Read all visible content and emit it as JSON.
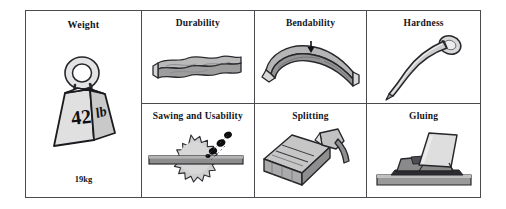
{
  "figure": {
    "name": "wood-properties-comparison-chart",
    "background_color": "#ffffff",
    "border_color": "#4a4a4f",
    "fill_light": "#e8e8e8",
    "fill_mid": "#bfbfbf",
    "fill_dark": "#8f8f8f",
    "ink_color": "#15151a"
  },
  "cells": {
    "weight": {
      "title": "Weight",
      "value_on_icon_number": "42",
      "value_on_icon_unit": "lb",
      "caption": "19kg",
      "icon": "weight-block-icon"
    },
    "durability": {
      "title": "Durability",
      "icon": "wooden-plank-icon"
    },
    "bendability": {
      "title": "Bendability",
      "icon": "bent-beam-with-arrow-icon"
    },
    "hardness": {
      "title": "Hardness",
      "icon": "bent-nail-icon"
    },
    "sawing": {
      "title": "Sawing and Usability",
      "icon": "circular-saw-blade-icon"
    },
    "splitting": {
      "title": "Splitting",
      "icon": "log-and-axe-icon"
    },
    "gluing": {
      "title": "Gluing",
      "icon": "glued-boards-icon"
    }
  }
}
